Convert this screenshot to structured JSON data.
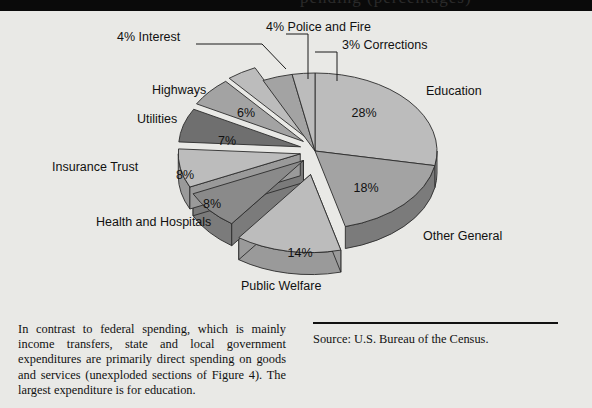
{
  "figure": {
    "top_band_partial_text": "pending (percentages)",
    "caption": "In contrast to federal spending, which is mainly income transfers, state and local government expenditures are primarily direct spending on goods and services (unexploded sections of Figure 4). The largest expenditure is for education.",
    "source": "Source: U.S. Bureau of the Census.",
    "colors": {
      "background": "#e9e9e6",
      "slice_light": "#bcbcbc",
      "slice_mid": "#a3a3a3",
      "slice_dark": "#8a8a8a",
      "slice_darkest": "#6f6f6f",
      "edge": "#2b2b2b",
      "side_light": "#9a9a9a",
      "side_dark": "#7b7b7b",
      "text": "#111111"
    }
  },
  "chart_data": {
    "type": "pie",
    "title": "",
    "xlabel": "",
    "ylabel": "",
    "legend_position": "callout-labels",
    "grid": false,
    "units": "percent",
    "total": 100,
    "categories": [
      "Education",
      "Other General",
      "Public Welfare",
      "Health and Hospitals",
      "Insurance Trust",
      "Utilities",
      "Highways",
      "Interest",
      "Police and Fire",
      "Corrections"
    ],
    "values": [
      28,
      18,
      14,
      8,
      8,
      7,
      6,
      4,
      4,
      3
    ],
    "labels": [
      "28%",
      "18%",
      "14%",
      "8%",
      "8%",
      "7%",
      "6%",
      "4% Interest",
      "4% Police and Fire",
      "3% Corrections"
    ],
    "slices": [
      {
        "name": "Education",
        "value": 28,
        "pct_label": "28%",
        "outside_label": "Education",
        "exploded": false,
        "callout": false
      },
      {
        "name": "Other General",
        "value": 18,
        "pct_label": "18%",
        "outside_label": "Other General",
        "exploded": false,
        "callout": false
      },
      {
        "name": "Public Welfare",
        "value": 14,
        "pct_label": "14%",
        "outside_label": "Public Welfare",
        "exploded": true,
        "callout": false
      },
      {
        "name": "Health and Hospitals",
        "value": 8,
        "pct_label": "8%",
        "outside_label": "Health and Hospitals",
        "exploded": true,
        "callout": false
      },
      {
        "name": "Insurance Trust",
        "value": 8,
        "pct_label": "8%",
        "outside_label": "Insurance Trust",
        "exploded": true,
        "callout": false
      },
      {
        "name": "Utilities",
        "value": 7,
        "pct_label": "7%",
        "outside_label": "Utilities",
        "exploded": true,
        "callout": false
      },
      {
        "name": "Highways",
        "value": 6,
        "pct_label": "6%",
        "outside_label": "Highways",
        "exploded": true,
        "callout": false
      },
      {
        "name": "Interest",
        "value": 4,
        "pct_label": "4%",
        "outside_label": "4% Interest",
        "exploded": true,
        "callout": true
      },
      {
        "name": "Police and Fire",
        "value": 4,
        "pct_label": "4%",
        "outside_label": "4% Police and Fire",
        "exploded": false,
        "callout": true
      },
      {
        "name": "Corrections",
        "value": 3,
        "pct_label": "3%",
        "outside_label": "3% Corrections",
        "exploded": false,
        "callout": true
      }
    ]
  }
}
